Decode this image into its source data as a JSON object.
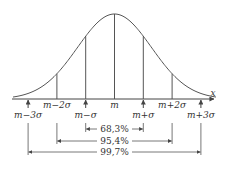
{
  "diagram": {
    "axis_label": "x",
    "tick_labels": [
      "m−3σ",
      "m−2σ",
      "m−σ",
      "m",
      "m+σ",
      "m+2σ",
      "m+3σ"
    ],
    "intervals": [
      {
        "label": "68,3%",
        "from": "m−σ",
        "to": "m+σ"
      },
      {
        "label": "95,4%",
        "from": "m−2σ",
        "to": "m+2σ"
      },
      {
        "label": "99,7%",
        "from": "m−3σ",
        "to": "m+3σ"
      }
    ],
    "colors": {
      "line": "#555555",
      "text": "#333333"
    }
  }
}
